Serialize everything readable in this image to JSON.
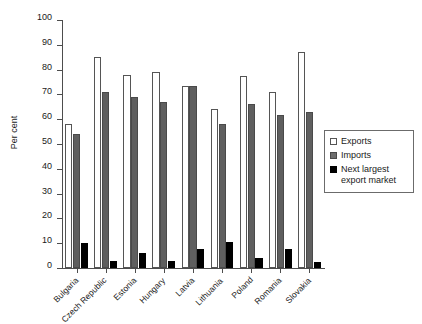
{
  "chart_data": {
    "type": "bar",
    "title": "",
    "xlabel": "",
    "ylabel": "Per cent",
    "ylim": [
      0,
      100
    ],
    "yticks": [
      0,
      10,
      20,
      30,
      40,
      50,
      60,
      70,
      80,
      90,
      100
    ],
    "grid": false,
    "legend_position": "right",
    "categories": [
      "Bulgaria",
      "Czech Republic",
      "Estonia",
      "Hungary",
      "Latvia",
      "Lithuania",
      "Poland",
      "Romania",
      "Slovakia"
    ],
    "series": [
      {
        "name": "Exports",
        "color": "#ffffff",
        "values": [
          58,
          85,
          78,
          79,
          73.5,
          64,
          77.5,
          71,
          87
        ]
      },
      {
        "name": "Imports",
        "color": "#5f5f5f",
        "values": [
          54,
          71,
          69,
          67,
          73.5,
          58,
          66,
          61.5,
          63
        ]
      },
      {
        "name": "Next largest export market",
        "color": "#000000",
        "values": [
          10,
          3,
          6,
          3,
          7.5,
          10.5,
          4,
          7.5,
          2.5
        ]
      }
    ]
  }
}
